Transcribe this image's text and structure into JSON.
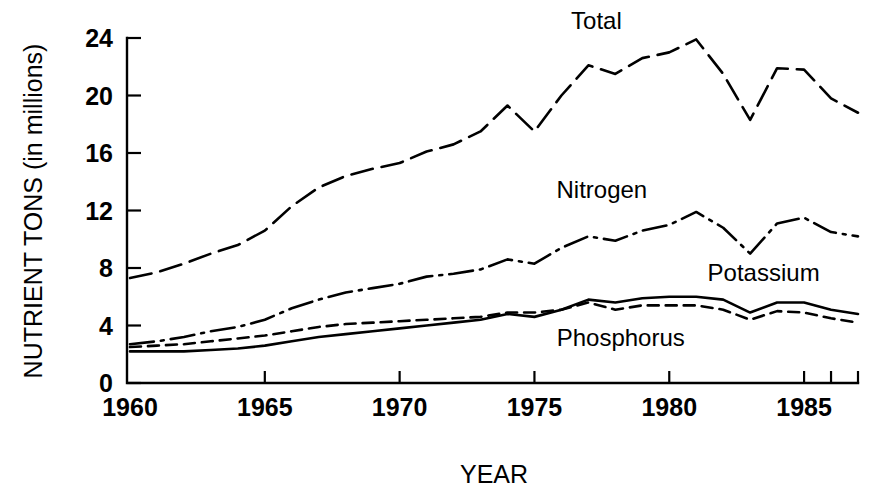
{
  "chart_data": {
    "type": "line",
    "title": "",
    "xlabel": "YEAR",
    "ylabel": "NUTRIENT TONS (in millions)",
    "xlim": [
      1960,
      1987
    ],
    "ylim": [
      0,
      24
    ],
    "xticks": [
      1960,
      1965,
      1970,
      1975,
      1980,
      1985
    ],
    "xtick_labels": [
      "1960",
      "1965",
      "1970",
      "1975",
      "1980",
      "1985"
    ],
    "xminor_ticks": [
      1986,
      1987
    ],
    "yticks": [
      0,
      4,
      8,
      12,
      16,
      20,
      24
    ],
    "ytick_labels": [
      "0",
      "4",
      "8",
      "12",
      "16",
      "20",
      "24"
    ],
    "grid": false,
    "legend_position": "inline-annotations",
    "x": [
      1960,
      1961,
      1962,
      1963,
      1964,
      1965,
      1966,
      1967,
      1968,
      1969,
      1970,
      1971,
      1972,
      1973,
      1974,
      1975,
      1976,
      1977,
      1978,
      1979,
      1980,
      1981,
      1982,
      1983,
      1984,
      1985,
      1986,
      1987
    ],
    "series": [
      {
        "name": "Total",
        "line_style": "long-dash",
        "dasharray": "22,9",
        "label": "Total",
        "label_x": 1977.3,
        "label_y": 24.6,
        "values": [
          7.3,
          7.7,
          8.3,
          9.0,
          9.6,
          10.6,
          12.3,
          13.6,
          14.4,
          14.9,
          15.3,
          16.1,
          16.6,
          17.5,
          19.3,
          17.5,
          20.0,
          22.1,
          21.5,
          22.6,
          23.0,
          23.9,
          21.5,
          18.3,
          21.9,
          21.8,
          19.8,
          18.8
        ]
      },
      {
        "name": "Nitrogen",
        "line_style": "dash-dot",
        "dasharray": "24,7,3,7",
        "label": "Nitrogen",
        "label_x": 1977.5,
        "label_y": 12.9,
        "values": [
          2.7,
          2.9,
          3.2,
          3.6,
          3.9,
          4.4,
          5.2,
          5.8,
          6.3,
          6.6,
          6.9,
          7.4,
          7.6,
          7.9,
          8.6,
          8.3,
          9.4,
          10.2,
          9.9,
          10.6,
          11.0,
          11.9,
          10.8,
          9.0,
          11.1,
          11.5,
          10.5,
          10.2
        ]
      },
      {
        "name": "Phosphorus",
        "line_style": "short-dash",
        "dasharray": "11,7",
        "label": "Phosphorus",
        "label_x": 1978.2,
        "label_y": 2.6,
        "values": [
          2.5,
          2.6,
          2.7,
          2.9,
          3.1,
          3.3,
          3.6,
          3.9,
          4.1,
          4.2,
          4.3,
          4.4,
          4.5,
          4.6,
          4.9,
          4.9,
          5.1,
          5.6,
          5.1,
          5.4,
          5.4,
          5.4,
          5.1,
          4.4,
          5.0,
          4.9,
          4.5,
          4.2
        ]
      },
      {
        "name": "Potassium",
        "line_style": "solid",
        "dasharray": "none",
        "label": "Potassium",
        "label_x": 1983.5,
        "label_y": 7.1,
        "values": [
          2.2,
          2.2,
          2.2,
          2.3,
          2.4,
          2.6,
          2.9,
          3.2,
          3.4,
          3.6,
          3.8,
          4.0,
          4.2,
          4.4,
          4.8,
          4.6,
          5.1,
          5.8,
          5.6,
          5.9,
          6.0,
          6.0,
          5.8,
          4.9,
          5.6,
          5.6,
          5.1,
          4.8
        ]
      }
    ]
  },
  "plot_geometry": {
    "x0": 130,
    "x1": 858,
    "y0": 383,
    "y1": 38
  }
}
